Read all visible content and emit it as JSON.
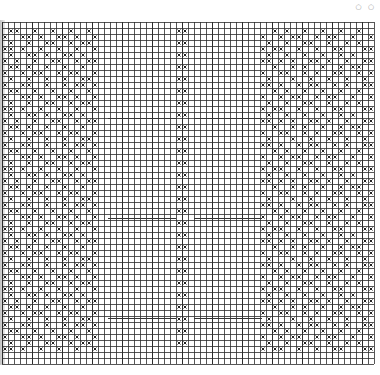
{
  "corner_marks": "○ ○",
  "grid": {
    "cols": 62,
    "rows": 57,
    "cell": 6,
    "line_color": "#2b2b2b",
    "mark_color": "#222222",
    "mark_symbol": "X"
  },
  "bands": {
    "left_pattern_cols": [
      0,
      17
    ],
    "center_column_cols": [
      29,
      31
    ],
    "right_pattern_cols": [
      43,
      62
    ]
  },
  "pattern_rows": [
    "X..XX..X..X.XX.X",
    ".XX..X..X..X..X.",
    "X..XX.X..XX.X..X",
    ".X..X..XX..X.XX.",
    "XX.X..X..X..X..X",
    ".X..XX.X..XX.X..",
    "X.X..X..XX..X.XX",
    ".XX.X..X..X..X..",
    "X..X.XX..X.XX..X",
    ".X..X..X..X..XX."
  ],
  "right_pattern_rows": [
    "XX.X..X.XX..X.X..XX",
    "..X.X..X..X..X..X..",
    "X..X.XX..X.XX..X..X",
    ".X..X..XX..X..X.X..",
    "X.XX..X..X..XX...XX",
    ".X..X..X..X..X.X...",
    "XX.X.X..XX.X..X..XX",
    "..X..X.X..X..X.XX..",
    "X..XX..X.X..XX..X.X",
    ".X...X..X..X..X..X."
  ],
  "horizontal_rules_y": [
    118,
    218,
    318
  ],
  "horizontal_rule_segments": [
    [
      108,
      176
    ],
    [
      194,
      262
    ]
  ]
}
